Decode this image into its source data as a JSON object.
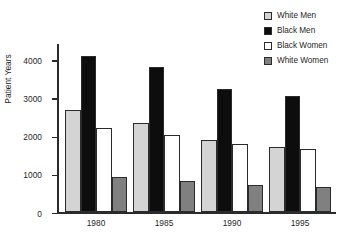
{
  "chart_data": {
    "type": "bar",
    "title": "",
    "xlabel": "",
    "ylabel": "Patient Years",
    "categories": [
      "1980",
      "1985",
      "1990",
      "1995"
    ],
    "ylim": [
      0,
      4400
    ],
    "yticks": [
      0,
      1000,
      2000,
      3000,
      4000
    ],
    "ytick_labels": [
      "0",
      "1000",
      "2000",
      "3000",
      "4000"
    ],
    "grid": false,
    "legend_position": "top-right",
    "series": [
      {
        "name": "White Men",
        "color": "#d4d4d4",
        "values": [
          2680,
          2340,
          1890,
          1720
        ]
      },
      {
        "name": "Black Men",
        "color": "#0d0d0d",
        "values": [
          4100,
          3820,
          3240,
          3060
        ]
      },
      {
        "name": "Black Women",
        "color": "#ffffff",
        "values": [
          2200,
          2040,
          1800,
          1670
        ]
      },
      {
        "name": "White Women",
        "color": "#808080",
        "values": [
          920,
          830,
          710,
          670
        ]
      }
    ]
  },
  "legend": {
    "items": [
      {
        "label": "White Men",
        "color": "#d4d4d4"
      },
      {
        "label": "Black Men",
        "color": "#0d0d0d"
      },
      {
        "label": "Black Women",
        "color": "#ffffff"
      },
      {
        "label": "White Women",
        "color": "#808080"
      }
    ]
  },
  "axes": {
    "y_title": "Patient Years",
    "y_tick_labels": [
      "4000",
      "3000",
      "2000",
      "1000",
      "0"
    ],
    "x_tick_labels": [
      "1980",
      "1985",
      "1990",
      "1995"
    ]
  }
}
